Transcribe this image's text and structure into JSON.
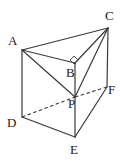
{
  "figure": {
    "background_color": "#ffffff",
    "stroke_color": "#3a3a3a",
    "label_color": "#1a1a1a",
    "width": 124,
    "height": 162
  },
  "vertices": [
    {
      "id": "A",
      "label": "A",
      "x": 22,
      "y": 50,
      "label_x": 8,
      "label_y": 34,
      "hidden": false
    },
    {
      "id": "B",
      "label": "B",
      "x": 75,
      "y": 63,
      "label_x": 66,
      "label_y": 66,
      "hidden": false
    },
    {
      "id": "C",
      "label": "C",
      "x": 108,
      "y": 28,
      "label_x": 105,
      "label_y": 9,
      "hidden": false
    },
    {
      "id": "D",
      "label": "D",
      "x": 22,
      "y": 117,
      "label_x": 7,
      "label_y": 116,
      "hidden": false
    },
    {
      "id": "E",
      "label": "E",
      "x": 75,
      "y": 137,
      "label_x": 70,
      "label_y": 143,
      "hidden": false
    },
    {
      "id": "F",
      "label": "F",
      "x": 107,
      "y": 87,
      "label_x": 108,
      "label_y": 83,
      "hidden": false
    },
    {
      "id": "P",
      "label": "P",
      "x": 75,
      "y": 97,
      "label_x": 68,
      "label_y": 97,
      "hidden": false
    }
  ],
  "edges": [
    {
      "id": "AC",
      "from": "A",
      "to": "C",
      "style": "solid",
      "x1": 22,
      "y1": 50,
      "x2": 108,
      "y2": 28
    },
    {
      "id": "AB",
      "from": "A",
      "to": "B",
      "style": "solid",
      "x1": 22,
      "y1": 50,
      "x2": 75,
      "y2": 63
    },
    {
      "id": "BC",
      "from": "B",
      "to": "C",
      "style": "solid",
      "x1": 75,
      "y1": 63,
      "x2": 108,
      "y2": 28
    },
    {
      "id": "AP",
      "from": "A",
      "to": "P",
      "style": "solid",
      "x1": 22,
      "y1": 50,
      "x2": 75,
      "y2": 97
    },
    {
      "id": "CP",
      "from": "C",
      "to": "P",
      "style": "solid",
      "x1": 108,
      "y1": 28,
      "x2": 75,
      "y2": 97
    },
    {
      "id": "AD",
      "from": "A",
      "to": "D",
      "style": "solid",
      "x1": 22,
      "y1": 50,
      "x2": 22,
      "y2": 117
    },
    {
      "id": "CF",
      "from": "C",
      "to": "F",
      "style": "solid",
      "x1": 108,
      "y1": 28,
      "x2": 107,
      "y2": 87
    },
    {
      "id": "BP",
      "from": "B",
      "to": "P",
      "style": "solid",
      "x1": 75,
      "y1": 63,
      "x2": 75,
      "y2": 97
    },
    {
      "id": "PE",
      "from": "P",
      "to": "E",
      "style": "solid",
      "x1": 75,
      "y1": 97,
      "x2": 75,
      "y2": 137
    },
    {
      "id": "DE",
      "from": "D",
      "to": "E",
      "style": "solid",
      "x1": 22,
      "y1": 117,
      "x2": 75,
      "y2": 137
    },
    {
      "id": "EF",
      "from": "E",
      "to": "F",
      "style": "solid",
      "x1": 75,
      "y1": 137,
      "x2": 107,
      "y2": 87
    },
    {
      "id": "DP",
      "from": "D",
      "to": "P",
      "style": "dashed",
      "x1": 22,
      "y1": 117,
      "x2": 75,
      "y2": 97
    },
    {
      "id": "PF",
      "from": "P",
      "to": "F",
      "style": "dashed",
      "x1": 75,
      "y1": 97,
      "x2": 107,
      "y2": 87
    }
  ],
  "angle_marks": [
    {
      "id": "right-angle-at-B",
      "at_vertex": "B",
      "type": "right-angle",
      "points": "70,60 74,56 78,60 74,64"
    }
  ]
}
